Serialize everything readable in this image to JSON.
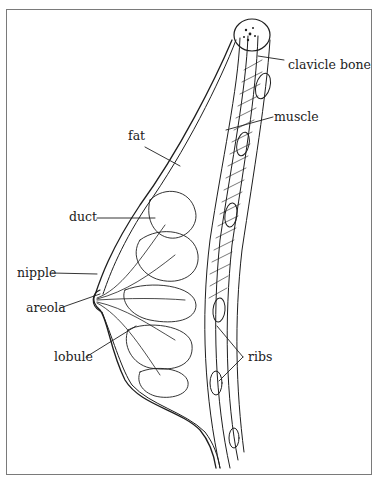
{
  "diagram": {
    "type": "anatomical cross-section illustration",
    "labels": {
      "clavicle": "clavicle bone",
      "muscle": "muscle",
      "fat": "fat",
      "duct": "duct",
      "nipple": "nipple",
      "areola": "areola",
      "lobule": "lobule",
      "ribs": "ribs"
    },
    "colors": {
      "line": "#1e1e1e",
      "frame": "#7a7a7a",
      "background": "#ffffff"
    }
  }
}
